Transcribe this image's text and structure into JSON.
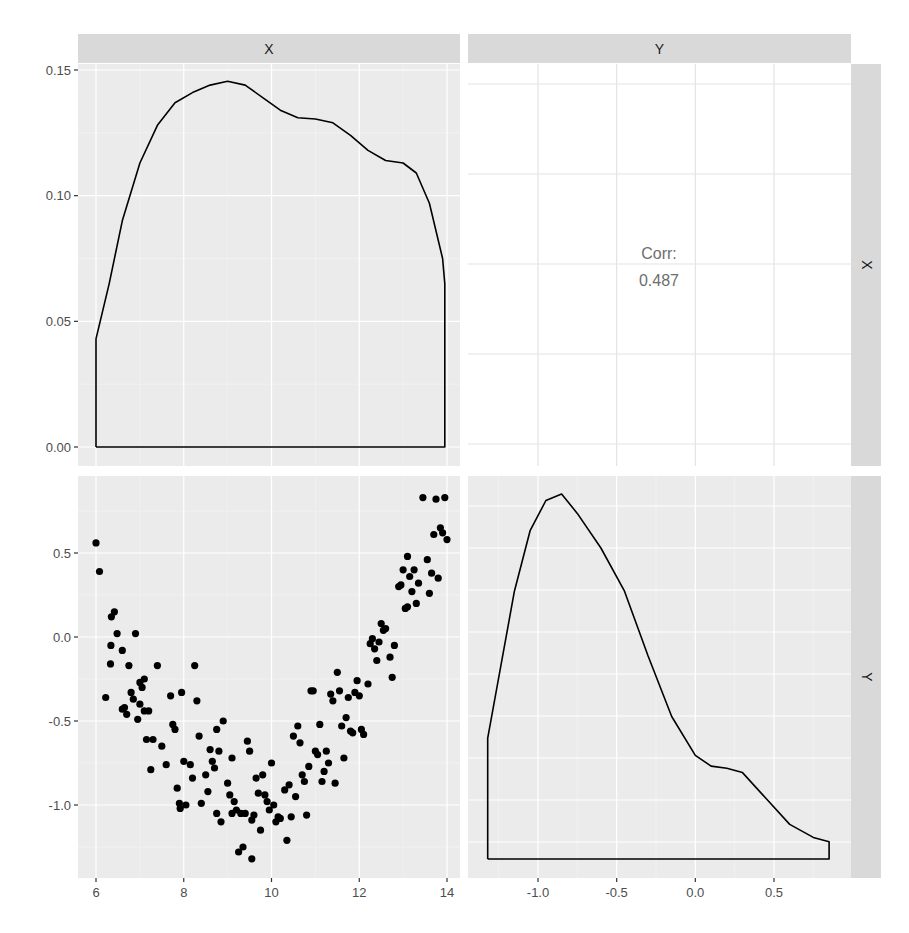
{
  "chart_data": {
    "type": "pairs-matrix",
    "title": "",
    "variables": [
      "X",
      "Y"
    ],
    "layout": {
      "rows": 2,
      "cols": 2,
      "grid": true,
      "theme": "ggplot2 grey",
      "strip_position": [
        "top",
        "right"
      ]
    },
    "panels": [
      {
        "id": "X-X",
        "row": 0,
        "col": 0,
        "type": "density",
        "variable": "X",
        "xlim": [
          5.6,
          14.3
        ],
        "ylim": [
          -0.0075,
          0.152
        ],
        "y_ticks": [
          0.0,
          0.05,
          0.1,
          0.15
        ],
        "y_tick_labels": [
          "0.00",
          "0.05",
          "0.10",
          "0.15"
        ],
        "curve": [
          [
            6.0,
            0.0
          ],
          [
            6.0,
            0.043
          ],
          [
            6.3,
            0.065
          ],
          [
            6.6,
            0.09
          ],
          [
            7.0,
            0.113
          ],
          [
            7.4,
            0.128
          ],
          [
            7.8,
            0.137
          ],
          [
            8.2,
            0.141
          ],
          [
            8.6,
            0.144
          ],
          [
            9.0,
            0.1455
          ],
          [
            9.4,
            0.144
          ],
          [
            9.8,
            0.139
          ],
          [
            10.2,
            0.134
          ],
          [
            10.6,
            0.131
          ],
          [
            11.0,
            0.1305
          ],
          [
            11.4,
            0.129
          ],
          [
            11.8,
            0.124
          ],
          [
            12.2,
            0.118
          ],
          [
            12.6,
            0.114
          ],
          [
            13.0,
            0.113
          ],
          [
            13.3,
            0.109
          ],
          [
            13.6,
            0.097
          ],
          [
            13.9,
            0.075
          ],
          [
            13.95,
            0.065
          ],
          [
            13.95,
            0.0
          ],
          [
            6.0,
            0.0
          ]
        ]
      },
      {
        "id": "Y-X",
        "row": 0,
        "col": 1,
        "type": "correlation-text",
        "label": "Corr:",
        "value": "0.487"
      },
      {
        "id": "X-Y",
        "row": 1,
        "col": 0,
        "type": "scatter",
        "xlabel": "X",
        "ylabel": "Y",
        "xlim": [
          5.6,
          14.3
        ],
        "ylim": [
          -1.39,
          0.96
        ],
        "x_ticks": [
          6,
          8,
          10,
          12,
          14
        ],
        "x_tick_labels": [
          "6",
          "8",
          "10",
          "12",
          "14"
        ],
        "y_ticks": [
          -1.0,
          -0.5,
          0.0,
          0.5
        ],
        "y_tick_labels": [
          "-1.0",
          "-0.5",
          "0.0",
          "0.5"
        ],
        "points": [
          [
            6.0,
            0.56
          ],
          [
            6.08,
            0.39
          ],
          [
            6.22,
            -0.36
          ],
          [
            6.35,
            0.12
          ],
          [
            6.42,
            0.15
          ],
          [
            6.34,
            -0.05
          ],
          [
            6.33,
            -0.16
          ],
          [
            6.48,
            0.02
          ],
          [
            6.6,
            -0.08
          ],
          [
            6.6,
            -0.43
          ],
          [
            6.65,
            -0.42
          ],
          [
            6.7,
            -0.46
          ],
          [
            6.75,
            -0.17
          ],
          [
            6.8,
            -0.33
          ],
          [
            6.85,
            -0.37
          ],
          [
            6.9,
            0.02
          ],
          [
            6.95,
            -0.49
          ],
          [
            7.0,
            -0.4
          ],
          [
            7.0,
            -0.27
          ],
          [
            7.05,
            -0.3
          ],
          [
            7.1,
            -0.25
          ],
          [
            7.1,
            -0.44
          ],
          [
            7.15,
            -0.61
          ],
          [
            7.2,
            -0.44
          ],
          [
            7.25,
            -0.79
          ],
          [
            7.3,
            -0.61
          ],
          [
            7.4,
            -0.17
          ],
          [
            7.5,
            -0.65
          ],
          [
            7.6,
            -0.76
          ],
          [
            7.7,
            -0.35
          ],
          [
            7.75,
            -0.52
          ],
          [
            7.8,
            -0.55
          ],
          [
            7.85,
            -0.9
          ],
          [
            7.9,
            -0.99
          ],
          [
            7.92,
            -1.02
          ],
          [
            7.95,
            -0.33
          ],
          [
            8.0,
            -0.74
          ],
          [
            8.05,
            -1.0
          ],
          [
            8.15,
            -0.76
          ],
          [
            8.2,
            -0.84
          ],
          [
            8.25,
            -0.17
          ],
          [
            8.3,
            -0.38
          ],
          [
            8.35,
            -0.59
          ],
          [
            8.4,
            -0.99
          ],
          [
            8.5,
            -0.82
          ],
          [
            8.55,
            -0.92
          ],
          [
            8.6,
            -0.67
          ],
          [
            8.65,
            -0.74
          ],
          [
            8.7,
            -0.78
          ],
          [
            8.75,
            -0.55
          ],
          [
            8.75,
            -1.05
          ],
          [
            8.8,
            -0.68
          ],
          [
            8.85,
            -1.1
          ],
          [
            8.9,
            -0.5
          ],
          [
            9.0,
            -0.87
          ],
          [
            9.05,
            -0.94
          ],
          [
            9.1,
            -1.05
          ],
          [
            9.1,
            -0.72
          ],
          [
            9.15,
            -0.98
          ],
          [
            9.2,
            -1.03
          ],
          [
            9.25,
            -1.28
          ],
          [
            9.3,
            -1.05
          ],
          [
            9.35,
            -1.25
          ],
          [
            9.4,
            -1.05
          ],
          [
            9.45,
            -0.62
          ],
          [
            9.5,
            -0.68
          ],
          [
            9.55,
            -1.09
          ],
          [
            9.55,
            -1.32
          ],
          [
            9.6,
            -1.06
          ],
          [
            9.65,
            -0.84
          ],
          [
            9.7,
            -0.93
          ],
          [
            9.75,
            -1.15
          ],
          [
            9.8,
            -0.82
          ],
          [
            9.85,
            -0.94
          ],
          [
            9.9,
            -0.98
          ],
          [
            9.95,
            -1.03
          ],
          [
            10.0,
            -0.75
          ],
          [
            10.05,
            -1.0
          ],
          [
            10.1,
            -1.1
          ],
          [
            10.15,
            -1.07
          ],
          [
            10.2,
            -1.08
          ],
          [
            10.3,
            -0.91
          ],
          [
            10.35,
            -1.21
          ],
          [
            10.4,
            -0.88
          ],
          [
            10.45,
            -1.07
          ],
          [
            10.5,
            -0.59
          ],
          [
            10.55,
            -0.95
          ],
          [
            10.6,
            -0.53
          ],
          [
            10.65,
            -0.63
          ],
          [
            10.7,
            -0.82
          ],
          [
            10.75,
            -0.86
          ],
          [
            10.8,
            -1.06
          ],
          [
            10.85,
            -0.77
          ],
          [
            10.9,
            -0.32
          ],
          [
            10.95,
            -0.32
          ],
          [
            11.0,
            -0.68
          ],
          [
            11.05,
            -0.7
          ],
          [
            11.1,
            -0.52
          ],
          [
            11.15,
            -0.86
          ],
          [
            11.2,
            -0.8
          ],
          [
            11.25,
            -0.68
          ],
          [
            11.3,
            -0.75
          ],
          [
            11.35,
            -0.34
          ],
          [
            11.4,
            -0.38
          ],
          [
            11.45,
            -0.87
          ],
          [
            11.5,
            -0.21
          ],
          [
            11.55,
            -0.32
          ],
          [
            11.6,
            -0.53
          ],
          [
            11.65,
            -0.72
          ],
          [
            11.7,
            -0.48
          ],
          [
            11.75,
            -0.36
          ],
          [
            11.8,
            -0.56
          ],
          [
            11.85,
            -0.57
          ],
          [
            11.9,
            -0.33
          ],
          [
            11.95,
            -0.26
          ],
          [
            12.0,
            -0.35
          ],
          [
            12.05,
            -0.55
          ],
          [
            12.1,
            -0.58
          ],
          [
            12.2,
            -0.28
          ],
          [
            12.25,
            -0.04
          ],
          [
            12.3,
            -0.01
          ],
          [
            12.35,
            -0.07
          ],
          [
            12.4,
            -0.14
          ],
          [
            12.45,
            -0.03
          ],
          [
            12.5,
            0.08
          ],
          [
            12.55,
            0.04
          ],
          [
            12.6,
            0.05
          ],
          [
            12.7,
            -0.12
          ],
          [
            12.75,
            -0.24
          ],
          [
            12.8,
            -0.05
          ],
          [
            12.9,
            0.3
          ],
          [
            12.95,
            0.31
          ],
          [
            13.0,
            0.4
          ],
          [
            13.05,
            0.17
          ],
          [
            13.1,
            0.18
          ],
          [
            13.1,
            0.48
          ],
          [
            13.15,
            0.36
          ],
          [
            13.2,
            0.27
          ],
          [
            13.25,
            0.4
          ],
          [
            13.3,
            0.2
          ],
          [
            13.35,
            0.32
          ],
          [
            13.45,
            0.83
          ],
          [
            13.55,
            0.46
          ],
          [
            13.6,
            0.26
          ],
          [
            13.65,
            0.38
          ],
          [
            13.7,
            0.61
          ],
          [
            13.75,
            0.82
          ],
          [
            13.8,
            0.35
          ],
          [
            13.85,
            0.65
          ],
          [
            13.9,
            0.62
          ],
          [
            13.95,
            0.83
          ],
          [
            14.0,
            0.58
          ]
        ]
      },
      {
        "id": "Y-Y",
        "row": 1,
        "col": 1,
        "type": "density",
        "variable": "Y",
        "xlim": [
          -1.45,
          0.98
        ],
        "ylim": [
          -0.03,
          0.87
        ],
        "x_ticks": [
          -1.0,
          -0.5,
          0.0,
          0.5
        ],
        "x_tick_labels": [
          "-1.0",
          "-0.5",
          "0.0",
          "0.5"
        ],
        "curve": [
          [
            -1.32,
            0.0
          ],
          [
            -1.32,
            0.28
          ],
          [
            -1.25,
            0.42
          ],
          [
            -1.15,
            0.62
          ],
          [
            -1.05,
            0.76
          ],
          [
            -0.95,
            0.83
          ],
          [
            -0.85,
            0.845
          ],
          [
            -0.75,
            0.8
          ],
          [
            -0.6,
            0.72
          ],
          [
            -0.45,
            0.62
          ],
          [
            -0.3,
            0.47
          ],
          [
            -0.15,
            0.33
          ],
          [
            0.0,
            0.24
          ],
          [
            0.1,
            0.215
          ],
          [
            0.2,
            0.21
          ],
          [
            0.3,
            0.2
          ],
          [
            0.45,
            0.14
          ],
          [
            0.6,
            0.08
          ],
          [
            0.75,
            0.05
          ],
          [
            0.85,
            0.04
          ],
          [
            0.85,
            0.0
          ],
          [
            -1.32,
            0.0
          ]
        ]
      }
    ],
    "strips": {
      "top": [
        "X",
        "Y"
      ],
      "right": [
        "X",
        "Y"
      ]
    },
    "colors": {
      "panel_bg": "#ebebeb",
      "strip_bg": "#d9d9d9",
      "grid_major": "#ffffff",
      "line": "#000000",
      "point": "#000000",
      "corr_text": "#6e6e6e"
    }
  }
}
